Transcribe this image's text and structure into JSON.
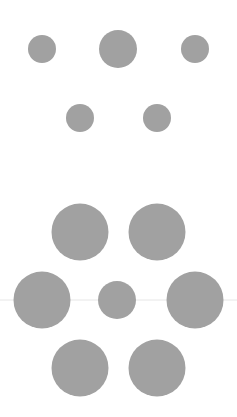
{
  "canvas": {
    "width": 237,
    "height": 417,
    "background": "#ffffff"
  },
  "colors": {
    "circle_fill": "#a1a1a1",
    "guide_line": "#e6e6e6"
  },
  "groups": [
    {
      "name": "upper-group",
      "circles": [
        {
          "cx": 42,
          "cy": 49,
          "r": 14
        },
        {
          "cx": 118,
          "cy": 49,
          "r": 19
        },
        {
          "cx": 195,
          "cy": 49,
          "r": 14
        },
        {
          "cx": 80,
          "cy": 118,
          "r": 14
        },
        {
          "cx": 157,
          "cy": 118,
          "r": 14
        }
      ]
    },
    {
      "name": "lower-group",
      "circles": [
        {
          "cx": 80,
          "cy": 232,
          "r": 28.5
        },
        {
          "cx": 157,
          "cy": 232,
          "r": 28.5
        },
        {
          "cx": 42,
          "cy": 300,
          "r": 28.5
        },
        {
          "cx": 117,
          "cy": 300,
          "r": 19
        },
        {
          "cx": 195,
          "cy": 300,
          "r": 28.5
        },
        {
          "cx": 80,
          "cy": 368,
          "r": 28.5
        },
        {
          "cx": 157,
          "cy": 368,
          "r": 28.5
        }
      ]
    }
  ],
  "guide_line": {
    "y": 300
  }
}
